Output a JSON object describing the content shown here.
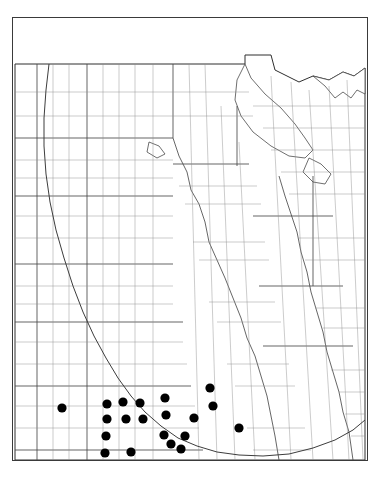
{
  "plate": {
    "number": "839.",
    "species": "Euphorbia albomarginata",
    "authority": "T. & G.",
    "full_caption": "839.  Euphorbia albomarginata T. & G."
  },
  "map": {
    "type": "dot-distribution-map",
    "region": "Great Plains",
    "symbol": "filled-black-circle",
    "symbol_meaning": "county record of occurrence",
    "dot_radius_px": 4.6,
    "frame": {
      "x": 12,
      "y": 17,
      "width": 356,
      "height": 444
    },
    "canvas": {
      "width": 354,
      "height": 414
    }
  },
  "colors": {
    "dot": "#000000",
    "county_line": "#8e8e8e",
    "state_line": "#4a4a4a",
    "outer_border": "#2e2e2e",
    "range_line": "#3d3d3d",
    "paper": "#ffffff",
    "caption_text": "#1a1a1a"
  },
  "chart_data": {
    "type": "scatter",
    "title": "839.  Euphorbia albomarginata T. & G.",
    "xlabel": "",
    "ylabel": "",
    "xlim": [
      0,
      354
    ],
    "ylim": [
      0,
      414
    ],
    "grid": false,
    "legend": "none",
    "series": [
      {
        "name": "county occurrence records",
        "marker": "filled circle",
        "color": "#000000",
        "points": [
          [
            49,
            362
          ],
          [
            94,
            358
          ],
          [
            110,
            356
          ],
          [
            127,
            357
          ],
          [
            94,
            373
          ],
          [
            113,
            373
          ],
          [
            130,
            373
          ],
          [
            93,
            390
          ],
          [
            92,
            407
          ],
          [
            110,
            423
          ],
          [
            131,
            423
          ],
          [
            151,
            423
          ],
          [
            118,
            406
          ],
          [
            152,
            352
          ],
          [
            153,
            369
          ],
          [
            151,
            389
          ],
          [
            158,
            398
          ],
          [
            168,
            403
          ],
          [
            172,
            390
          ],
          [
            181,
            372
          ],
          [
            197,
            342
          ],
          [
            200,
            360
          ],
          [
            226,
            382
          ]
        ]
      }
    ]
  },
  "dot_rows": {
    "note": "Records cluster in the southwestern quadrant of the mapped area",
    "isolated_west": 1,
    "main_cluster": 11,
    "eastern_cluster": 11
  }
}
